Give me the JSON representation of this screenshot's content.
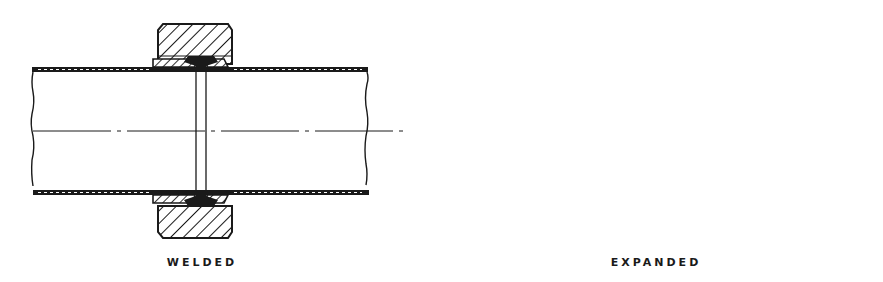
{
  "figure": {
    "panels": [
      {
        "id": "welded",
        "label": "WELDED"
      },
      {
        "id": "expanded",
        "label": "EXPANDED"
      }
    ],
    "colors": {
      "ink": "#1a1a1a",
      "background": "#ffffff"
    }
  }
}
